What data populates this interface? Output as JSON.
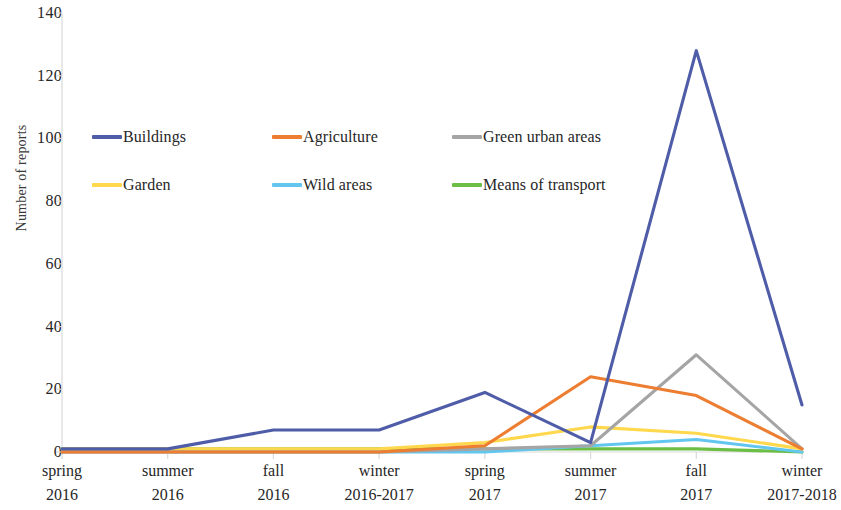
{
  "chart_data": {
    "type": "line",
    "title": "",
    "xlabel": "",
    "ylabel": "Number of reports",
    "ylim": [
      0,
      140
    ],
    "ytick_step": 20,
    "yticks": [
      0,
      20,
      40,
      60,
      80,
      100,
      120,
      140
    ],
    "grid": false,
    "legend_position": "inside-upper-left",
    "categories": [
      "spring 2016",
      "summer 2016",
      "fall 2016",
      "winter 2016-2017",
      "spring 2017",
      "summer 2017",
      "fall 2017",
      "winter 2017-2018"
    ],
    "category_lines": [
      {
        "l1": "spring",
        "l2": "2016"
      },
      {
        "l1": "summer",
        "l2": "2016"
      },
      {
        "l1": "fall",
        "l2": "2016"
      },
      {
        "l1": "winter",
        "l2": "2016-2017"
      },
      {
        "l1": "spring",
        "l2": "2017"
      },
      {
        "l1": "summer",
        "l2": "2017"
      },
      {
        "l1": "fall",
        "l2": "2017"
      },
      {
        "l1": "winter",
        "l2": "2017-2018"
      }
    ],
    "series": [
      {
        "name": "Buildings",
        "color": "#4f5da8",
        "values": [
          1,
          1,
          7,
          7,
          19,
          3,
          128,
          15
        ]
      },
      {
        "name": "Agriculture",
        "color": "#ed7d31",
        "values": [
          0,
          0,
          0,
          0,
          2,
          24,
          18,
          1
        ]
      },
      {
        "name": "Green urban areas",
        "color": "#a5a5a5",
        "values": [
          0,
          0,
          0,
          0,
          1,
          2,
          31,
          1
        ]
      },
      {
        "name": "Garden",
        "color": "#ffd84d",
        "values": [
          1,
          1,
          1,
          1,
          3,
          8,
          6,
          1
        ]
      },
      {
        "name": "Wild areas",
        "color": "#63c6ef",
        "values": [
          0,
          0,
          0,
          0,
          0,
          2,
          4,
          0
        ]
      },
      {
        "name": "Means of transport",
        "color": "#6cbe45",
        "values": [
          1,
          1,
          1,
          1,
          1,
          1,
          1,
          0
        ]
      }
    ]
  },
  "legend": {
    "rows": [
      [
        {
          "label": "Buildings",
          "color": "#4f5da8"
        },
        {
          "label": "Agriculture",
          "color": "#ed7d31"
        },
        {
          "label": "Green urban areas",
          "color": "#a5a5a5"
        }
      ],
      [
        {
          "label": "Garden",
          "color": "#ffd84d"
        },
        {
          "label": "Wild areas",
          "color": "#63c6ef"
        },
        {
          "label": "Means of transport",
          "color": "#6cbe45"
        }
      ]
    ]
  },
  "axes": {
    "y_title": "Number of reports",
    "axis_color": "#d9d9d9"
  }
}
